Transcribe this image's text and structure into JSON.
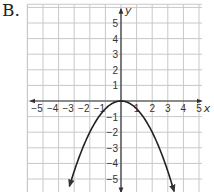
{
  "label": "B.",
  "chart_data": {
    "type": "line",
    "title": "",
    "function": "y = -0.5 x^2",
    "xlabel": "x",
    "ylabel": "y",
    "xlim": [
      -6,
      5.2
    ],
    "ylim": [
      -5.9,
      6.2
    ],
    "grid": true,
    "x_ticks": [
      -5,
      -4,
      -3,
      -2,
      -1,
      1,
      2,
      3,
      4,
      5
    ],
    "y_ticks": [
      5,
      4,
      3,
      2,
      1,
      -1,
      -2,
      -3,
      -4,
      -5
    ],
    "x_tick_labels": [
      "−5",
      "−4",
      "−3",
      "−2",
      "−1",
      "1",
      "2",
      "3",
      "4",
      "5"
    ],
    "y_tick_labels": [
      "5",
      "4",
      "3",
      "2",
      "1",
      "−1",
      "−2",
      "−3",
      "−4",
      "−5"
    ],
    "series": [
      {
        "name": "parabola",
        "x": [
          -3.3,
          -3,
          -2,
          -1,
          0,
          1,
          2,
          3,
          3.4
        ],
        "y": [
          -5.45,
          -4.5,
          -2,
          -0.5,
          0,
          -0.5,
          -2,
          -4.5,
          -5.78
        ]
      }
    ],
    "vertex": [
      0,
      0
    ],
    "arrows": "both ends of curve, both ends of x-axis, both ends of y-axis"
  },
  "colors": {
    "grid": "#c8c8c8",
    "axis": "#333333",
    "curve": "#222222"
  }
}
